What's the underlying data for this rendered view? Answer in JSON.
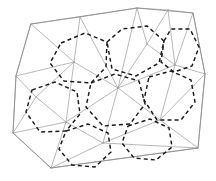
{
  "figure": {
    "type": "diagram",
    "width": 216,
    "height": 181,
    "background_color": "#ffffff",
    "mesh_line_color": "#9a9a9a",
    "boundary_line_color": "#8d8d8d",
    "dual_line_color": "#1a1a1a",
    "dual_dash_pattern": "4 3.1",
    "boundary": {
      "name": "outer-polygon",
      "closed": true,
      "points": [
        [
          31,
          24
        ],
        [
          137,
          8
        ],
        [
          193,
          13
        ],
        [
          205,
          74
        ],
        [
          198,
          148
        ],
        [
          51,
          168
        ],
        [
          13,
          133
        ],
        [
          16,
          76
        ]
      ]
    },
    "mesh_nodes": [
      [
        31,
        24
      ],
      [
        137,
        8
      ],
      [
        193,
        13
      ],
      [
        205,
        74
      ],
      [
        198,
        148
      ],
      [
        51,
        168
      ],
      [
        13,
        133
      ],
      [
        16,
        76
      ],
      [
        80,
        17
      ],
      [
        168,
        10
      ],
      [
        66,
        122
      ],
      [
        118,
        88
      ],
      [
        175,
        65
      ],
      [
        160,
        120
      ],
      [
        103,
        143
      ],
      [
        74,
        62
      ],
      [
        147,
        44
      ],
      [
        36,
        97
      ]
    ],
    "mesh_edges": [
      [
        [
          31,
          24
        ],
        [
          80,
          17
        ]
      ],
      [
        [
          80,
          17
        ],
        [
          137,
          8
        ]
      ],
      [
        [
          137,
          8
        ],
        [
          168,
          10
        ]
      ],
      [
        [
          168,
          10
        ],
        [
          193,
          13
        ]
      ],
      [
        [
          193,
          13
        ],
        [
          205,
          74
        ]
      ],
      [
        [
          205,
          74
        ],
        [
          198,
          148
        ]
      ],
      [
        [
          198,
          148
        ],
        [
          51,
          168
        ]
      ],
      [
        [
          51,
          168
        ],
        [
          13,
          133
        ]
      ],
      [
        [
          13,
          133
        ],
        [
          16,
          76
        ]
      ],
      [
        [
          16,
          76
        ],
        [
          31,
          24
        ]
      ],
      [
        [
          16,
          76
        ],
        [
          74,
          62
        ]
      ],
      [
        [
          31,
          24
        ],
        [
          74,
          62
        ]
      ],
      [
        [
          80,
          17
        ],
        [
          74,
          62
        ]
      ],
      [
        [
          80,
          17
        ],
        [
          118,
          88
        ]
      ],
      [
        [
          137,
          8
        ],
        [
          118,
          88
        ]
      ],
      [
        [
          137,
          8
        ],
        [
          147,
          44
        ]
      ],
      [
        [
          168,
          10
        ],
        [
          147,
          44
        ]
      ],
      [
        [
          147,
          44
        ],
        [
          175,
          65
        ]
      ],
      [
        [
          168,
          10
        ],
        [
          175,
          65
        ]
      ],
      [
        [
          193,
          13
        ],
        [
          175,
          65
        ]
      ],
      [
        [
          175,
          65
        ],
        [
          205,
          74
        ]
      ],
      [
        [
          147,
          44
        ],
        [
          118,
          88
        ]
      ],
      [
        [
          74,
          62
        ],
        [
          118,
          88
        ]
      ],
      [
        [
          16,
          76
        ],
        [
          36,
          97
        ]
      ],
      [
        [
          36,
          97
        ],
        [
          74,
          62
        ]
      ],
      [
        [
          36,
          97
        ],
        [
          66,
          122
        ]
      ],
      [
        [
          66,
          122
        ],
        [
          74,
          62
        ]
      ],
      [
        [
          13,
          133
        ],
        [
          36,
          97
        ]
      ],
      [
        [
          13,
          133
        ],
        [
          66,
          122
        ]
      ],
      [
        [
          66,
          122
        ],
        [
          118,
          88
        ]
      ],
      [
        [
          66,
          122
        ],
        [
          103,
          143
        ]
      ],
      [
        [
          103,
          143
        ],
        [
          118,
          88
        ]
      ],
      [
        [
          51,
          168
        ],
        [
          66,
          122
        ]
      ],
      [
        [
          51,
          168
        ],
        [
          103,
          143
        ]
      ],
      [
        [
          103,
          143
        ],
        [
          160,
          120
        ]
      ],
      [
        [
          118,
          88
        ],
        [
          160,
          120
        ]
      ],
      [
        [
          118,
          88
        ],
        [
          175,
          65
        ]
      ],
      [
        [
          175,
          65
        ],
        [
          160,
          120
        ]
      ],
      [
        [
          160,
          120
        ],
        [
          205,
          74
        ]
      ],
      [
        [
          160,
          120
        ],
        [
          198,
          148
        ]
      ],
      [
        [
          103,
          143
        ],
        [
          198,
          148
        ]
      ]
    ],
    "dual_cells": [
      {
        "name": "dual-cell-upper-left",
        "points": [
          [
            61,
            43
          ],
          [
            85,
            33
          ],
          [
            107,
            42
          ],
          [
            106,
            67
          ],
          [
            91,
            83
          ],
          [
            64,
            81
          ],
          [
            50,
            63
          ]
        ]
      },
      {
        "name": "dual-cell-upper-center",
        "points": [
          [
            107,
            42
          ],
          [
            122,
            29
          ],
          [
            147,
            26
          ],
          [
            164,
            41
          ],
          [
            159,
            63
          ],
          [
            136,
            76
          ],
          [
            112,
            69
          ]
        ]
      },
      {
        "name": "dual-cell-upper-right",
        "points": [
          [
            164,
            41
          ],
          [
            171,
            29
          ],
          [
            190,
            29
          ],
          [
            199,
            47
          ],
          [
            192,
            66
          ],
          [
            174,
            72
          ],
          [
            161,
            62
          ]
        ]
      },
      {
        "name": "dual-cell-left",
        "points": [
          [
            32,
            90
          ],
          [
            55,
            82
          ],
          [
            77,
            92
          ],
          [
            80,
            114
          ],
          [
            66,
            131
          ],
          [
            40,
            132
          ],
          [
            26,
            112
          ]
        ]
      },
      {
        "name": "dual-cell-center",
        "points": [
          [
            91,
            83
          ],
          [
            115,
            74
          ],
          [
            139,
            81
          ],
          [
            145,
            104
          ],
          [
            130,
            124
          ],
          [
            103,
            126
          ],
          [
            86,
            107
          ]
        ]
      },
      {
        "name": "dual-cell-right",
        "points": [
          [
            149,
            77
          ],
          [
            171,
            71
          ],
          [
            191,
            80
          ],
          [
            195,
            102
          ],
          [
            181,
            120
          ],
          [
            157,
            120
          ],
          [
            144,
            100
          ]
        ]
      },
      {
        "name": "dual-cell-lower-left",
        "points": [
          [
            66,
            131
          ],
          [
            88,
            124
          ],
          [
            108,
            133
          ],
          [
            111,
            152
          ],
          [
            95,
            167
          ],
          [
            72,
            165
          ],
          [
            59,
            149
          ]
        ]
      },
      {
        "name": "dual-cell-lower-right",
        "points": [
          [
            128,
            126
          ],
          [
            150,
            119
          ],
          [
            169,
            128
          ],
          [
            172,
            147
          ],
          [
            156,
            160
          ],
          [
            134,
            158
          ],
          [
            122,
            143
          ]
        ]
      }
    ]
  }
}
